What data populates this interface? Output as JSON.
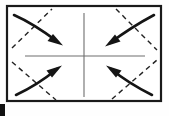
{
  "figure": {
    "canvas": {
      "width": 169,
      "height": 116,
      "background": "#fefefe"
    },
    "colors": {
      "stroke": "#151515",
      "sheet_border": "#1a1a1a",
      "axis_line": "#6e6e6e",
      "dashed_fold": "#222222",
      "artifact": "#111111"
    },
    "sheet": {
      "name": "paper-sheet",
      "x": 7,
      "y": 6,
      "width": 154,
      "height": 95,
      "border_width": 2.2
    },
    "axes": [
      {
        "name": "horizontal-center-axis",
        "orientation": "horizontal",
        "x1": 25,
        "y1": 56,
        "x2": 145,
        "y2": 56,
        "width": 1.1
      },
      {
        "name": "vertical-center-axis",
        "orientation": "vertical",
        "x1": 84,
        "y1": 13,
        "x2": 84,
        "y2": 97,
        "width": 1.1
      }
    ],
    "fold_lines": [
      {
        "name": "fold-line-top-left",
        "quadrant": "top-left",
        "x1": 12,
        "y1": 48,
        "x2": 52,
        "y2": 9,
        "dash": "5,4",
        "width": 1.4
      },
      {
        "name": "fold-line-top-right",
        "quadrant": "top-right",
        "x1": 116,
        "y1": 9,
        "x2": 157,
        "y2": 50,
        "dash": "5,4",
        "width": 1.4
      },
      {
        "name": "fold-line-bottom-left",
        "quadrant": "bottom-left",
        "x1": 12,
        "y1": 62,
        "x2": 56,
        "y2": 100,
        "dash": "5,4",
        "width": 1.4
      },
      {
        "name": "fold-line-bottom-right",
        "quadrant": "bottom-right",
        "x1": 112,
        "y1": 99,
        "x2": 157,
        "y2": 60,
        "dash": "5,4",
        "width": 1.4
      }
    ],
    "arrows": [
      {
        "name": "fold-arrow-top-left",
        "quadrant": "top-left",
        "direction": "down-right-toward-center",
        "path": "M 14,15 C 30,22 46,33 58,42",
        "head": "61,44 49,41.5 52.5,36",
        "width": 2.6
      },
      {
        "name": "fold-arrow-top-right",
        "quadrant": "top-right",
        "direction": "down-left-toward-center",
        "path": "M 154,15 C 139,23 122,34 110,43",
        "head": "107,45 119,42 115.5,36.5",
        "width": 2.6
      },
      {
        "name": "fold-arrow-bottom-left",
        "quadrant": "bottom-left",
        "direction": "up-right-toward-center",
        "path": "M 16,95 C 31,88 46,78 57,69",
        "head": "60,67 48,69.5 51.5,75",
        "width": 2.6
      },
      {
        "name": "fold-arrow-bottom-right",
        "quadrant": "bottom-right",
        "direction": "up-left-toward-center",
        "path": "M 152,95 C 138,88 122,78 111,69",
        "head": "108,67 120,69.5 116.5,75",
        "width": 2.6
      }
    ],
    "artifacts": [
      {
        "name": "page-edge-mark",
        "x": 0,
        "y": 104,
        "width": 5,
        "height": 12
      }
    ]
  }
}
